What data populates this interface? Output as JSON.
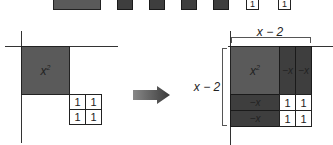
{
  "top_row": {
    "tiles": [
      {
        "kind": "x-squared",
        "label": ""
      },
      {
        "kind": "negative-x",
        "label": ""
      },
      {
        "kind": "negative-x",
        "label": ""
      },
      {
        "kind": "negative-x",
        "label": ""
      },
      {
        "kind": "negative-x",
        "label": ""
      },
      {
        "kind": "unit",
        "label": "1"
      },
      {
        "kind": "unit",
        "label": "1"
      }
    ]
  },
  "left_figure": {
    "x_squared_label": "x",
    "x_squared_exp": "2",
    "units": [
      "1",
      "1",
      "1",
      "1"
    ]
  },
  "arrow": {
    "icon": "right-arrow-icon"
  },
  "right_figure": {
    "top_dimension": "x − 2",
    "side_dimension": "x − 2",
    "x_squared_label": "x",
    "x_squared_exp": "2",
    "neg_x_labels": [
      "−x",
      "−x",
      "−x",
      "−x"
    ],
    "units": [
      "1",
      "1",
      "1",
      "1"
    ]
  },
  "colors": {
    "x_squared": "#5a5a5a",
    "negative_x": "#3e3e3e",
    "unit": "#ffffff"
  }
}
